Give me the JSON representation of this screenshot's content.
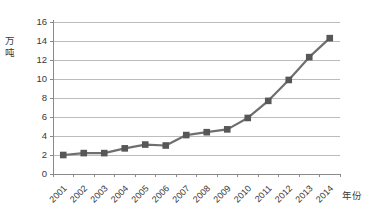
{
  "chart_data": {
    "type": "line",
    "title": "",
    "xlabel": "年份",
    "ylabel": "万吨",
    "categories": [
      "2001",
      "2002",
      "2003",
      "2004",
      "2005",
      "2006",
      "2007",
      "2008",
      "2009",
      "2010",
      "2011",
      "2012",
      "2013",
      "2014"
    ],
    "series": [
      {
        "name": "annual-output",
        "values": [
          2.0,
          2.2,
          2.2,
          2.7,
          3.1,
          3.0,
          4.1,
          4.4,
          4.7,
          5.9,
          7.7,
          9.9,
          12.3,
          14.3
        ]
      }
    ],
    "ylim": [
      0,
      16
    ],
    "yticks": [
      0,
      2,
      4,
      6,
      8,
      10,
      12,
      14,
      16
    ],
    "grid": true,
    "legend_position": "none",
    "marker": "square",
    "colors": {
      "line": "#6f6f6f",
      "marker": "#575757",
      "gridline": "#b5b5b5",
      "axis": "#8a8a8a",
      "text": "#383838",
      "background": "#ffffff"
    }
  }
}
